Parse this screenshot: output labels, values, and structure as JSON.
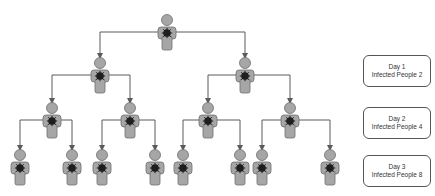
{
  "diagram": {
    "colors": {
      "person_fill": "#a6a6a6",
      "person_stroke": "#6e6e6e",
      "virus": "#1e1e1e",
      "connector": "#5a5a5a"
    },
    "levels": [
      {
        "level": 0,
        "people_x": [
          167
        ],
        "y": 14
      },
      {
        "level": 1,
        "people_x": [
          100,
          245
        ],
        "y": 57
      },
      {
        "level": 2,
        "people_x": [
          52,
          130,
          208,
          290
        ],
        "y": 102
      },
      {
        "level": 3,
        "people_x": [
          20,
          72,
          102,
          155,
          183,
          240,
          262,
          330
        ],
        "y": 149
      }
    ]
  },
  "legend": [
    {
      "day": "Day 1",
      "infected": "Infected People 2"
    },
    {
      "day": "Day 2",
      "infected": "Infected People 4"
    },
    {
      "day": "Day 3",
      "infected": "Infected People 8"
    }
  ]
}
